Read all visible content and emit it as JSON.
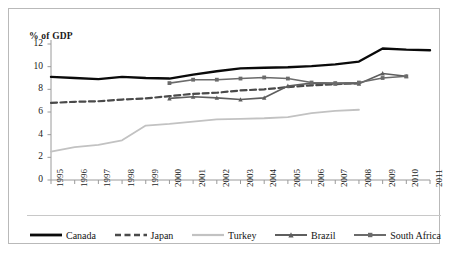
{
  "chart_data": {
    "type": "line",
    "title": "",
    "subtitle": "",
    "ylabel": "% of GDP",
    "xlabel": "",
    "ylim": [
      0,
      12
    ],
    "yticks": [
      0,
      2,
      4,
      6,
      8,
      10,
      12
    ],
    "grid": false,
    "legend_position": "bottom",
    "x": [
      1995,
      1996,
      1997,
      1998,
      1999,
      2000,
      2001,
      2002,
      2003,
      2004,
      2005,
      2006,
      2007,
      2008,
      2009,
      2010,
      2011
    ],
    "categories": [
      "1995",
      "1996",
      "1997",
      "1998",
      "1999",
      "2000",
      "2001",
      "2002",
      "2003",
      "2004",
      "2005",
      "2006",
      "2007",
      "2008",
      "2009",
      "2010",
      "2011"
    ],
    "series": [
      {
        "name": "Canada",
        "color": "#0a0a0a",
        "style": "solid",
        "width": 2.4,
        "marker": "none",
        "values": [
          9.1,
          9.0,
          8.9,
          9.1,
          9.0,
          8.95,
          9.3,
          9.6,
          9.85,
          9.9,
          9.95,
          10.05,
          10.2,
          10.45,
          11.6,
          11.5,
          11.45
        ]
      },
      {
        "name": "Japan",
        "color": "#4a4a4a",
        "style": "dashed",
        "width": 2.2,
        "marker": "none",
        "values": [
          6.8,
          6.9,
          6.95,
          7.1,
          7.2,
          7.4,
          7.6,
          7.7,
          7.9,
          8.0,
          8.2,
          8.35,
          8.45,
          8.55,
          null,
          null,
          null
        ]
      },
      {
        "name": "Turkey",
        "color": "#c2c2c2",
        "style": "solid",
        "width": 1.8,
        "marker": "none",
        "values": [
          2.5,
          2.9,
          3.1,
          3.5,
          4.8,
          4.95,
          5.15,
          5.35,
          5.4,
          5.45,
          5.55,
          5.9,
          6.1,
          6.2,
          null,
          null,
          null
        ]
      },
      {
        "name": "Brazil",
        "color": "#5e5e5e",
        "style": "solid",
        "width": 1.6,
        "marker": "triangle",
        "values": [
          null,
          null,
          null,
          null,
          null,
          7.2,
          7.35,
          7.25,
          7.1,
          7.25,
          8.3,
          8.55,
          8.5,
          8.5,
          9.4,
          9.15,
          null
        ]
      },
      {
        "name": "South Africa",
        "color": "#6b6b6b",
        "style": "solid",
        "width": 1.6,
        "marker": "square",
        "values": [
          null,
          null,
          null,
          null,
          null,
          8.55,
          8.85,
          8.85,
          8.95,
          9.05,
          8.95,
          8.6,
          8.55,
          8.6,
          9.0,
          9.15,
          null
        ]
      }
    ]
  }
}
